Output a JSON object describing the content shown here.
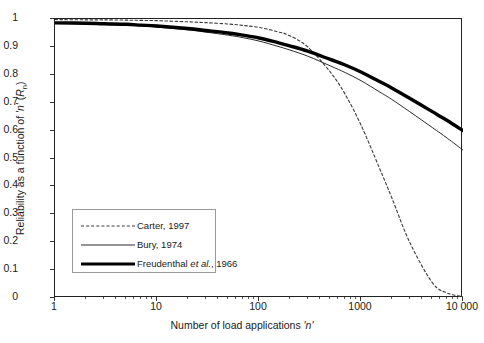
{
  "chart_data": {
    "type": "line",
    "title": "",
    "xlabel": "Number of load applications 'n'",
    "ylabel": "Reliability as a function of 'n' (Rn)",
    "ylabel_parts": {
      "main": "Reliability as a function of ",
      "italic1": "'n'",
      "mid": " (",
      "italic2": "R",
      "sub": "n",
      "end": ")"
    },
    "xlabel_parts": {
      "main": "Number of load applications ",
      "italic": "'n'"
    },
    "xscale": "log",
    "xlim": [
      1,
      10000
    ],
    "ylim": [
      0,
      1
    ],
    "grid": false,
    "legend_position": "lower-left-inside",
    "xticks": [
      "1",
      "10",
      "100",
      "1000",
      "10 000"
    ],
    "xtick_values": [
      1,
      10,
      100,
      1000,
      10000
    ],
    "yticks": [
      "0",
      "0.1",
      "0.2",
      "0.3",
      "0.4",
      "0.5",
      "0.6",
      "0.7",
      "0.8",
      "0.9",
      "1"
    ],
    "ytick_values": [
      0,
      0.1,
      0.2,
      0.3,
      0.4,
      0.5,
      0.6,
      0.7,
      0.8,
      0.9,
      1
    ],
    "x": [
      1,
      2,
      3,
      5,
      7,
      10,
      20,
      30,
      50,
      70,
      100,
      150,
      200,
      300,
      500,
      700,
      1000,
      1500,
      2000,
      3000,
      5000,
      7000,
      10000
    ],
    "series": [
      {
        "name": "Carter, 1997",
        "style": "dashed",
        "color": "#3a3a3a",
        "width": 1.1,
        "values": [
          0.998,
          0.997,
          0.997,
          0.996,
          0.995,
          0.994,
          0.99,
          0.987,
          0.982,
          0.977,
          0.97,
          0.955,
          0.94,
          0.9,
          0.81,
          0.73,
          0.62,
          0.47,
          0.36,
          0.2,
          0.055,
          0.018,
          0.005
        ]
      },
      {
        "name": "Bury, 1974",
        "style": "solid-thin",
        "color": "#2a2a2a",
        "width": 1.0,
        "values": [
          0.985,
          0.983,
          0.981,
          0.978,
          0.975,
          0.971,
          0.961,
          0.953,
          0.942,
          0.933,
          0.921,
          0.903,
          0.889,
          0.867,
          0.832,
          0.808,
          0.779,
          0.74,
          0.712,
          0.668,
          0.611,
          0.573,
          0.53
        ]
      },
      {
        "name": "Freudenthal et al., 1966",
        "name_parts": {
          "pre": "Freudenthal ",
          "italic": "et al.",
          "post": ", 1966"
        },
        "style": "solid-thick",
        "color": "#000000",
        "width": 3.4,
        "values": [
          0.986,
          0.985,
          0.983,
          0.981,
          0.978,
          0.975,
          0.966,
          0.959,
          0.95,
          0.942,
          0.932,
          0.916,
          0.904,
          0.885,
          0.855,
          0.835,
          0.81,
          0.777,
          0.753,
          0.716,
          0.668,
          0.636,
          0.6
        ]
      }
    ]
  },
  "legend": {
    "items": [
      {
        "label": "Carter, 1997"
      },
      {
        "label": "Bury, 1974"
      },
      {
        "label_pre": "Freudenthal ",
        "label_italic": "et al.",
        "label_post": ", 1966"
      }
    ]
  }
}
